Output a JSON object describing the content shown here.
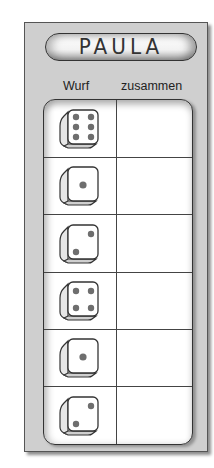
{
  "card": {
    "name": "PAULA",
    "columns": {
      "wurf": "Wurf",
      "zusammen": "zusammen"
    },
    "rows": [
      {
        "die_value": 6,
        "die_icon": "die-six-icon",
        "sum": ""
      },
      {
        "die_value": 1,
        "die_icon": "die-one-icon",
        "sum": ""
      },
      {
        "die_value": 2,
        "die_icon": "die-two-icon",
        "sum": ""
      },
      {
        "die_value": 4,
        "die_icon": "die-four-icon",
        "sum": ""
      },
      {
        "die_value": 1,
        "die_icon": "die-one-icon",
        "sum": ""
      },
      {
        "die_value": 2,
        "die_icon": "die-two-icon",
        "sum": ""
      }
    ]
  },
  "colors": {
    "card_bg": "#cfcfcf",
    "table_bg": "#ffffff",
    "ink": "#333333",
    "pip": "#6e6e6e"
  }
}
